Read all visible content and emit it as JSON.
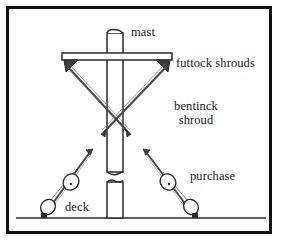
{
  "diagram": {
    "style": {
      "background_color": "#ffffff",
      "border_color": "#111111",
      "line_color": "#2b2b2b",
      "text_color": "#1a1a1a",
      "fill_color": "#ffffff"
    },
    "labels": {
      "mast": "mast",
      "futtock_shrouds": "futtock shrouds",
      "bentinck_shroud_line1": "bentinck",
      "bentinck_shroud_line2": "shroud",
      "purchase": "purchase",
      "deck": "deck"
    },
    "parts": [
      {
        "name": "mast",
        "kind": "vertical-spar",
        "segments": 2
      },
      {
        "name": "yard",
        "kind": "horizontal-spar"
      },
      {
        "name": "futtock-shrouds",
        "kind": "crossed-lines",
        "count": 2
      },
      {
        "name": "bentinck-shroud",
        "kind": "crossing-point"
      },
      {
        "name": "purchase-tackle-left",
        "kind": "block-and-tackle",
        "blocks": 2
      },
      {
        "name": "purchase-tackle-right",
        "kind": "block-and-tackle",
        "blocks": 2
      },
      {
        "name": "deck",
        "kind": "ground-line"
      }
    ]
  }
}
